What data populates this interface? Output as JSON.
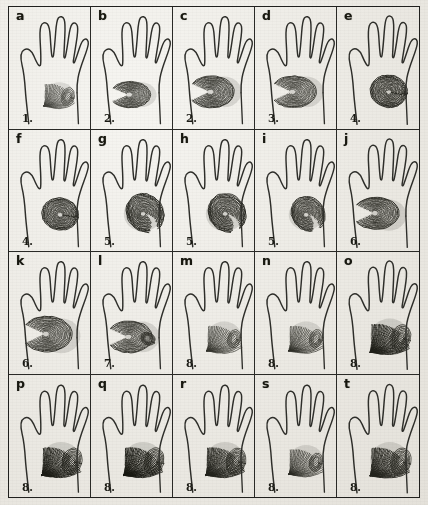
{
  "figure": {
    "kind": "hand-ridge-pattern-plate",
    "rows": 4,
    "columns": 5,
    "ink_color": "#2e2e2a",
    "paper_color": "#efefec",
    "ridge_color": "#16160f"
  },
  "cells": [
    {
      "letter": "a",
      "number": "1.",
      "pattern": "open-field-fan",
      "intensity": 0.55,
      "patch": "small"
    },
    {
      "letter": "b",
      "number": "2.",
      "pattern": "loop-low",
      "intensity": 0.7,
      "patch": "small"
    },
    {
      "letter": "c",
      "number": "2.",
      "pattern": "loop-low",
      "intensity": 0.78,
      "patch": "medium"
    },
    {
      "letter": "d",
      "number": "3.",
      "pattern": "loop-mid",
      "intensity": 0.72,
      "patch": "medium"
    },
    {
      "letter": "e",
      "number": "4.",
      "pattern": "whorl-concentric",
      "intensity": 0.86,
      "patch": "medium"
    },
    {
      "letter": "f",
      "number": "4.",
      "pattern": "whorl-concentric",
      "intensity": 0.84,
      "patch": "medium"
    },
    {
      "letter": "g",
      "number": "5.",
      "pattern": "whorl-spiral",
      "intensity": 0.92,
      "patch": "large"
    },
    {
      "letter": "h",
      "number": "5.",
      "pattern": "whorl-spiral",
      "intensity": 0.9,
      "patch": "large"
    },
    {
      "letter": "i",
      "number": "5.",
      "pattern": "whorl-spiral-open",
      "intensity": 0.8,
      "patch": "medium"
    },
    {
      "letter": "j",
      "number": "6.",
      "pattern": "loop-radial-high",
      "intensity": 0.82,
      "patch": "medium"
    },
    {
      "letter": "k",
      "number": "6.",
      "pattern": "loop-radial-high",
      "intensity": 0.84,
      "patch": "large"
    },
    {
      "letter": "l",
      "number": "7.",
      "pattern": "loop-twin",
      "intensity": 0.76,
      "patch": "medium"
    },
    {
      "letter": "m",
      "number": "8.",
      "pattern": "arch-fan",
      "intensity": 0.7,
      "patch": "medium"
    },
    {
      "letter": "n",
      "number": "8.",
      "pattern": "arch-fan",
      "intensity": 0.74,
      "patch": "medium"
    },
    {
      "letter": "o",
      "number": "8.",
      "pattern": "arch-fan-dense",
      "intensity": 0.88,
      "patch": "large"
    },
    {
      "letter": "p",
      "number": "8.",
      "pattern": "arch-fan-dense",
      "intensity": 0.94,
      "patch": "large"
    },
    {
      "letter": "q",
      "number": "8.",
      "pattern": "arch-fan-darkest",
      "intensity": 0.97,
      "patch": "large"
    },
    {
      "letter": "r",
      "number": "8.",
      "pattern": "arch-fan-dense",
      "intensity": 0.86,
      "patch": "large"
    },
    {
      "letter": "s",
      "number": "8.",
      "pattern": "arch-fan",
      "intensity": 0.78,
      "patch": "medium"
    },
    {
      "letter": "t",
      "number": "8.",
      "pattern": "arch-fan-dense",
      "intensity": 0.85,
      "patch": "large"
    }
  ]
}
